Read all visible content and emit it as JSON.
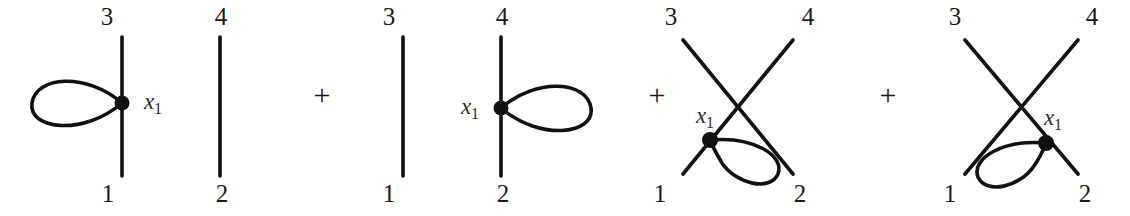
{
  "figure": {
    "background_color": "#ffffff",
    "stroke_color": "#111111",
    "text_color": "#1a1a1a",
    "expression_operator": "+",
    "terms": [
      {
        "id": "term-1",
        "description": "vertical propagator 1-3 with tadpole loop on left, plus separate propagator 2-4",
        "external_labels": {
          "top_left": "3",
          "bottom_left": "1",
          "top_right": "4",
          "bottom_right": "2"
        },
        "vertex_label": "x",
        "vertex_subscript": "1",
        "vertex_label_side": "right",
        "loop_side": "left"
      },
      {
        "id": "term-2",
        "description": "plain vertical propagator 1-3, plus vertical propagator 2-4 with tadpole loop on right",
        "external_labels": {
          "top_left": "3",
          "bottom_left": "1",
          "top_right": "4",
          "bottom_right": "2"
        },
        "vertex_label": "x",
        "vertex_subscript": "1",
        "vertex_label_side": "left",
        "loop_side": "right"
      },
      {
        "id": "term-3",
        "description": "crossed propagators 1-4 and 3-2 with tadpole loop attached on the lower-left leg",
        "external_labels": {
          "top_left": "3",
          "bottom_left": "1",
          "top_right": "4",
          "bottom_right": "2"
        },
        "vertex_label": "x",
        "vertex_subscript": "1",
        "vertex_label_side": "upper-left",
        "loop_side": "lower-right"
      },
      {
        "id": "term-4",
        "description": "crossed propagators 1-4 and 3-2 with tadpole loop attached on the lower-right leg",
        "external_labels": {
          "top_left": "3",
          "bottom_left": "1",
          "top_right": "4",
          "bottom_right": "2"
        },
        "vertex_label": "x",
        "vertex_subscript": "1",
        "vertex_label_side": "upper-right",
        "loop_side": "lower-left"
      }
    ],
    "operators": [
      "+",
      "+",
      "+"
    ]
  }
}
